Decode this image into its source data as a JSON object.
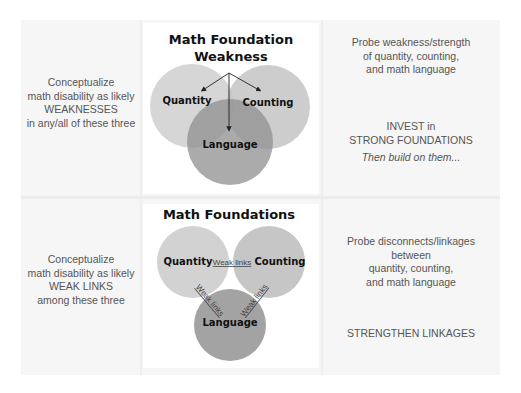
{
  "colors": {
    "background": "#ffffff",
    "panel": "#f6f6f6",
    "card": "#ffffff",
    "circle_light": "#c8c8c8",
    "circle_dark": "#9a9a9a",
    "text": "#555555",
    "title_text": "#111111"
  },
  "top_row": {
    "left_text": {
      "line1": "Conceptualize",
      "line2": "math disability as likely",
      "line3": "WEAKNESSES",
      "line4": "in any/all of these three"
    },
    "diagram": {
      "title_line1": "Math Foundation",
      "title_line2": "Weakness",
      "circles": [
        {
          "label": "Quantity"
        },
        {
          "label": "Counting"
        },
        {
          "label": "Language"
        }
      ]
    },
    "right_text": {
      "probe_line1": "Probe weakness/strength",
      "probe_line2": "of quantity, counting,",
      "probe_line3": "and math language",
      "invest_line1": "INVEST in",
      "invest_line2": "STRONG FOUNDATIONS",
      "then": "Then build on them..."
    }
  },
  "bottom_row": {
    "left_text": {
      "line1": "Conceptualize",
      "line2": "math disability as likely",
      "line3": "WEAK LINKS",
      "line4": "among these three"
    },
    "diagram": {
      "title": "Math Foundations",
      "circles": [
        {
          "label": "Quantity"
        },
        {
          "label": "Counting"
        },
        {
          "label": "Language"
        }
      ],
      "links": [
        {
          "label": "Weak links"
        },
        {
          "label": "Weak links"
        },
        {
          "label": "Weak links"
        }
      ]
    },
    "right_text": {
      "probe_line1": "Probe disconnects/linkages",
      "probe_line2": "between",
      "probe_line3": "quantity, counting,",
      "probe_line4": "and math language",
      "action": "STRENGTHEN LINKAGES"
    }
  }
}
